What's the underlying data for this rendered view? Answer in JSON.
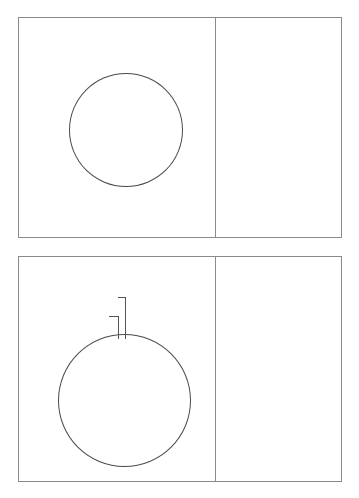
{
  "colors": {
    "lower_respiratory": "#9E94BE",
    "kidney_urinary": "#8B1527",
    "septicemia_dark_red": "#8B1527",
    "other_enteric": "#FAFAD2",
    "septicemia_lightblue": "#D4EDED",
    "kidney_lightblue": "#D4EDED",
    "cellulitis_dark": "#3D0A14",
    "prosthetic_dark": "#3D0A14",
    "prosthetic_orange": "#E8734A",
    "cellulitis_orange": "#E8734A",
    "frame": "#8a8a8a",
    "text": "#1b1b1b",
    "pct_text": "#3a3a3a"
  },
  "charts": [
    {
      "id": "chart-top",
      "chart_data": {
        "type": "pie",
        "title": "",
        "categories": [
          "Lower Respiratory Tract Infections",
          "Kidney, Urinary Tract and Bladder Infections",
          "Other: Enteric Infections, Upper Respiratory Tract Infections, Postoperative Infections",
          "Septicemia",
          "Cellulitis",
          "Infections and Inflammatory Reactions to Prostethic devices"
        ],
        "values": [
          46,
          16,
          15,
          12,
          8,
          3
        ],
        "value_labels": [
          "46%",
          "16%",
          "15%",
          "12%",
          "8%",
          "3%"
        ],
        "colors": [
          "#9E94BE",
          "#8B1527",
          "#FAFAD2",
          "#D4EDED",
          "#3D0A14",
          "#E8734A"
        ],
        "legend_position": "right",
        "start_angle_deg": 0
      },
      "labels": [
        {
          "text": "46%",
          "x": 160,
          "y": 110
        },
        {
          "text": "16%",
          "x": 86,
          "y": 197
        },
        {
          "text": "15%",
          "x": 24,
          "y": 150
        },
        {
          "text": "12%",
          "x": 27,
          "y": 110
        },
        {
          "text": "8%",
          "x": 66,
          "y": 64
        },
        {
          "text": "3%",
          "x": 110,
          "y": 57
        }
      ],
      "legend": [
        {
          "label": "Lower Respiratory Tract\nInfections",
          "color": "#9E94BE"
        },
        {
          "label": "Kidney, Urinary Tract and\nBladder Infections",
          "color": "#8B1527"
        },
        {
          "label": "Other: Enteric Infections,\nUpper Respiratory Tract\nInfections, Postoperative\nInfections",
          "color": "#FAFAD2"
        },
        {
          "label": "Septicemia",
          "color": "#D4EDED"
        },
        {
          "label": "Cellulitis",
          "color": "#3D0A14"
        },
        {
          "label": "Infections and\nInflammatory Reactions\nto Prostethic devices",
          "color": "#E8734A"
        }
      ]
    },
    {
      "id": "chart-bottom",
      "chart_data": {
        "type": "pie",
        "title": "",
        "categories": [
          "Lower Respiratory Tract Infections",
          "Septicemia",
          "Other: Enteric Infections, Upper Respiratory Tract Infections, Postoperative Infections",
          "Kidney, Urinary Tract and Bladder Infections",
          "Infections and Inflammatory Reactions to Prostethic devices",
          "Cellulitis"
        ],
        "values": [
          48,
          34,
          9,
          6,
          2,
          1
        ],
        "value_labels": [
          "48%",
          "34%",
          "9%",
          "6%",
          "2%",
          "1%"
        ],
        "colors": [
          "#9E94BE",
          "#8B1527",
          "#FAFAD2",
          "#D4EDED",
          "#3D0A14",
          "#E8734A"
        ],
        "legend_position": "right",
        "start_angle_deg": 0
      },
      "labels": [
        {
          "text": "48%",
          "x": 172,
          "y": 132
        },
        {
          "text": "34%",
          "x": 33,
          "y": 193
        },
        {
          "text": "9%",
          "x": 44,
          "y": 91
        },
        {
          "text": "6%",
          "x": 68,
          "y": 70
        },
        {
          "text": "1%",
          "x": 86,
          "y": 35
        },
        {
          "text": "2%",
          "x": 76,
          "y": 54
        }
      ],
      "legend": [
        {
          "label": "Lower Respiratory Tract\nInfections",
          "color": "#9E94BE"
        },
        {
          "label": "Septicemia",
          "color": "#8B1527"
        },
        {
          "label": "Other: Enteric Infections,\nUpper Respiratory Tract\nInfections, Postoperative\nInfections",
          "color": "#FAFAD2"
        },
        {
          "label": "Kidney, Urinary Tract and\nBladder Infections",
          "color": "#D4EDED"
        },
        {
          "label": "Infections and\nInflammatory Reactions to\nProstethic devices",
          "color": "#3D0A14"
        },
        {
          "label": "Cellulitis",
          "color": "#E8734A"
        }
      ]
    }
  ]
}
